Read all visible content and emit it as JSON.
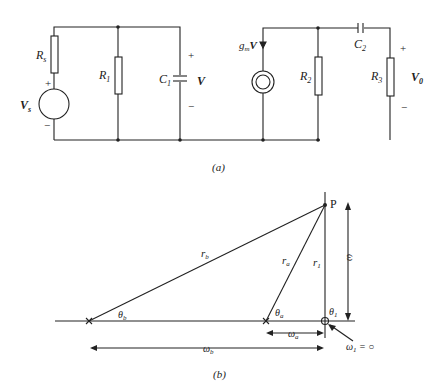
{
  "figure_a": {
    "caption": "(a)",
    "components": {
      "Rs": {
        "main": "R",
        "sub": "s"
      },
      "Vs": {
        "main": "V",
        "sub": "s"
      },
      "R1": {
        "main": "R",
        "sub": "1"
      },
      "C1": {
        "main": "C",
        "sub": "1"
      },
      "V": "V",
      "gmV": {
        "main": "g",
        "sub": "m",
        "tail": "V"
      },
      "R2": {
        "main": "R",
        "sub": "2"
      },
      "C2": {
        "main": "C",
        "sub": "2"
      },
      "R3": {
        "main": "R",
        "sub": "3"
      },
      "V0": {
        "main": "V",
        "sub": "0"
      }
    },
    "signs": {
      "plus": "+",
      "minus": "−"
    }
  },
  "figure_b": {
    "caption": "(b)",
    "point": "P",
    "labels": {
      "rb": {
        "main": "r",
        "sub": "b"
      },
      "ra": {
        "main": "r",
        "sub": "a"
      },
      "r1": {
        "main": "r",
        "sub": "1"
      },
      "omega": "ω",
      "theta_b": {
        "main": "θ",
        "sub": "b"
      },
      "theta_a": {
        "main": "θ",
        "sub": "a"
      },
      "theta_1": {
        "main": "θ",
        "sub": "1"
      },
      "omega_a": {
        "main": "ω",
        "sub": "a"
      },
      "omega_b": {
        "main": "ω",
        "sub": "b"
      },
      "omega_1": {
        "main": "ω",
        "sub": "1",
        "tail": " = ○"
      }
    }
  }
}
